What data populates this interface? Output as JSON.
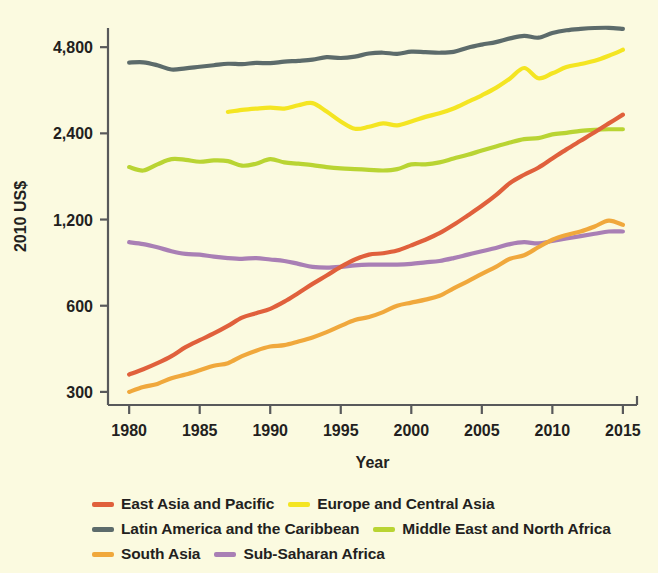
{
  "chart_data": {
    "type": "line",
    "title": "",
    "xlabel": "Year",
    "ylabel": "2010 US$",
    "yscale": "log2",
    "ylim": [
      270,
      5600
    ],
    "xlim": [
      1978.5,
      2016
    ],
    "grid": false,
    "legend_position": "bottom",
    "ytick_labels": [
      "4,800",
      "2,400",
      "1,200",
      "600",
      "300"
    ],
    "ytick_values": [
      4800,
      2400,
      1200,
      600,
      300
    ],
    "xtick_labels": [
      "1980",
      "1985",
      "1990",
      "1995",
      "2000",
      "2005",
      "2010",
      "2015"
    ],
    "xtick_values": [
      1980,
      1985,
      1990,
      1995,
      2000,
      2005,
      2010,
      2015
    ],
    "x": [
      1980,
      1981,
      1982,
      1983,
      1984,
      1985,
      1986,
      1987,
      1988,
      1989,
      1990,
      1991,
      1992,
      1993,
      1994,
      1995,
      1996,
      1997,
      1998,
      1999,
      2000,
      2001,
      2002,
      2003,
      2004,
      2005,
      2006,
      2007,
      2008,
      2009,
      2010,
      2011,
      2012,
      2013,
      2014,
      2015
    ],
    "series": [
      {
        "name": "East Asia and Pacific",
        "color": "#e0603c",
        "x": [
          1980,
          1981,
          1982,
          1983,
          1984,
          1985,
          1986,
          1987,
          1988,
          1989,
          1990,
          1991,
          1992,
          1993,
          1994,
          1995,
          1996,
          1997,
          1998,
          1999,
          2000,
          2001,
          2002,
          2003,
          2004,
          2005,
          2006,
          2007,
          2008,
          2009,
          2010,
          2011,
          2012,
          2013,
          2014,
          2015
        ],
        "values": [
          345,
          360,
          378,
          400,
          430,
          455,
          480,
          510,
          545,
          565,
          585,
          620,
          665,
          715,
          765,
          820,
          870,
          905,
          915,
          935,
          975,
          1020,
          1075,
          1150,
          1240,
          1340,
          1460,
          1610,
          1720,
          1820,
          1960,
          2110,
          2260,
          2420,
          2600,
          2790
        ]
      },
      {
        "name": "Europe and Central Asia",
        "color": "#f4e522",
        "x": [
          1987,
          1988,
          1989,
          1990,
          1991,
          1992,
          1993,
          1994,
          1995,
          1996,
          1997,
          1998,
          1999,
          2000,
          2001,
          2002,
          2003,
          2004,
          2005,
          2006,
          2007,
          2008,
          2009,
          2010,
          2011,
          2012,
          2013,
          2014,
          2015
        ],
        "values": [
          2850,
          2900,
          2930,
          2950,
          2930,
          3010,
          3060,
          2860,
          2640,
          2490,
          2530,
          2600,
          2560,
          2640,
          2740,
          2820,
          2930,
          3090,
          3260,
          3460,
          3730,
          4060,
          3740,
          3890,
          4090,
          4190,
          4300,
          4480,
          4700
        ]
      },
      {
        "name": "Latin America and the Caribbean",
        "color": "#5c6b6b",
        "x": [
          1980,
          1981,
          1982,
          1983,
          1984,
          1985,
          1986,
          1987,
          1988,
          1989,
          1990,
          1991,
          1992,
          1993,
          1994,
          1995,
          1996,
          1997,
          1998,
          1999,
          2000,
          2001,
          2002,
          2003,
          2004,
          2005,
          2006,
          2007,
          2008,
          2009,
          2010,
          2011,
          2012,
          2013,
          2014,
          2015
        ],
        "values": [
          4240,
          4250,
          4150,
          4010,
          4050,
          4100,
          4150,
          4200,
          4190,
          4230,
          4220,
          4270,
          4300,
          4340,
          4430,
          4400,
          4450,
          4560,
          4590,
          4550,
          4630,
          4610,
          4590,
          4620,
          4780,
          4900,
          5000,
          5150,
          5260,
          5180,
          5380,
          5500,
          5560,
          5600,
          5610,
          5560
        ]
      },
      {
        "name": "Middle East and North Africa",
        "color": "#b9d433",
        "x": [
          1980,
          1981,
          1982,
          1983,
          1984,
          1985,
          1986,
          1987,
          1988,
          1989,
          1990,
          1991,
          1992,
          1993,
          1994,
          1995,
          1996,
          1997,
          1998,
          1999,
          2000,
          2001,
          2002,
          2003,
          2004,
          2005,
          2006,
          2007,
          2008,
          2009,
          2010,
          2011,
          2012,
          2013,
          2014,
          2015
        ],
        "values": [
          1830,
          1780,
          1870,
          1950,
          1940,
          1910,
          1930,
          1920,
          1850,
          1880,
          1950,
          1900,
          1880,
          1860,
          1830,
          1810,
          1800,
          1790,
          1780,
          1800,
          1870,
          1870,
          1900,
          1960,
          2020,
          2090,
          2160,
          2230,
          2290,
          2310,
          2380,
          2410,
          2450,
          2470,
          2480,
          2480
        ]
      },
      {
        "name": "South Asia",
        "color": "#f0a83c",
        "x": [
          1980,
          1981,
          1982,
          1983,
          1984,
          1985,
          1986,
          1987,
          1988,
          1989,
          1990,
          1991,
          1992,
          1993,
          1994,
          1995,
          1996,
          1997,
          1998,
          1999,
          2000,
          2001,
          2002,
          2003,
          2004,
          2005,
          2006,
          2007,
          2008,
          2009,
          2010,
          2011,
          2012,
          2013,
          2014,
          2015
        ],
        "values": [
          300,
          312,
          320,
          335,
          345,
          357,
          370,
          378,
          400,
          418,
          432,
          437,
          450,
          465,
          485,
          510,
          535,
          548,
          570,
          600,
          615,
          630,
          650,
          690,
          730,
          775,
          820,
          875,
          900,
          960,
          1020,
          1060,
          1090,
          1135,
          1190,
          1150
        ]
      },
      {
        "name": "Sub-Saharan Africa",
        "color": "#a97fb5",
        "x": [
          1980,
          1981,
          1982,
          1983,
          1984,
          1985,
          1986,
          1987,
          1988,
          1989,
          1990,
          1991,
          1992,
          1993,
          1994,
          1995,
          1996,
          1997,
          1998,
          1999,
          2000,
          2001,
          2002,
          2003,
          2004,
          2005,
          2006,
          2007,
          2008,
          2009,
          2010,
          2011,
          2012,
          2013,
          2014,
          2015
        ],
        "values": [
          1000,
          985,
          960,
          930,
          910,
          905,
          890,
          880,
          875,
          880,
          870,
          860,
          840,
          820,
          815,
          820,
          830,
          835,
          835,
          835,
          840,
          850,
          860,
          880,
          905,
          930,
          955,
          985,
          1000,
          990,
          1010,
          1030,
          1050,
          1070,
          1090,
          1090
        ]
      }
    ]
  },
  "axes": {
    "ylabel": "2010 US$",
    "xlabel": "Year"
  },
  "legend": {
    "rows": [
      [
        {
          "label": "East Asia and Pacific",
          "color": "#e0603c"
        },
        {
          "label": "Europe and Central Asia",
          "color": "#f4e522"
        }
      ],
      [
        {
          "label": "Latin America and the Caribbean",
          "color": "#5c6b6b"
        },
        {
          "label": "Middle East and North Africa",
          "color": "#b9d433"
        }
      ],
      [
        {
          "label": "South Asia",
          "color": "#f0a83c"
        },
        {
          "label": "Sub-Saharan Africa",
          "color": "#a97fb5"
        }
      ]
    ]
  }
}
